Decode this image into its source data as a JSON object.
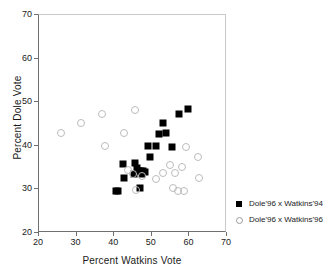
{
  "chart_data": {
    "type": "scatter",
    "title": "",
    "xlabel": "Percent Watkins Vote",
    "ylabel": "Percent Dole Vote",
    "xlim": [
      20,
      70
    ],
    "ylim": [
      20,
      70
    ],
    "xticks": [
      20,
      30,
      40,
      50,
      60,
      70
    ],
    "yticks": [
      20,
      30,
      40,
      50,
      60,
      70
    ],
    "grid": false,
    "legend_position": "right",
    "series": [
      {
        "name": "Dole'96 x Watkins'94",
        "marker": "filled-square",
        "color": "#000000",
        "points": [
          [
            40.7,
            29.4
          ],
          [
            41.3,
            29.5
          ],
          [
            42.6,
            35.6
          ],
          [
            42.9,
            32.3
          ],
          [
            45.9,
            35.9
          ],
          [
            45.4,
            33.3
          ],
          [
            46.3,
            34.6
          ],
          [
            46.8,
            33.9
          ],
          [
            47.3,
            34.0
          ],
          [
            47.6,
            33.2
          ],
          [
            48.0,
            33.9
          ],
          [
            48.4,
            33.8
          ],
          [
            47.2,
            30.1
          ],
          [
            49.3,
            39.7
          ],
          [
            49.8,
            37.1
          ],
          [
            51.5,
            39.8
          ],
          [
            52.2,
            42.5
          ],
          [
            53.3,
            45.0
          ],
          [
            54.0,
            42.8
          ],
          [
            55.6,
            39.5
          ],
          [
            57.6,
            47.1
          ],
          [
            59.9,
            48.1
          ]
        ]
      },
      {
        "name": "Dole'96 x Watkins'96",
        "marker": "open-circle",
        "color": "#bcbcbc",
        "points": [
          [
            26.2,
            42.6
          ],
          [
            31.4,
            45.0
          ],
          [
            37.0,
            47.1
          ],
          [
            37.8,
            39.7
          ],
          [
            43.0,
            42.8
          ],
          [
            44.0,
            34.2
          ],
          [
            45.9,
            48.0
          ],
          [
            45.2,
            33.3
          ],
          [
            46.1,
            29.7
          ],
          [
            47.6,
            32.9
          ],
          [
            51.4,
            32.2
          ],
          [
            53.3,
            33.6
          ],
          [
            55.2,
            35.4
          ],
          [
            55.9,
            30.1
          ],
          [
            56.5,
            33.5
          ],
          [
            57.2,
            29.4
          ],
          [
            58.3,
            34.8
          ],
          [
            58.8,
            29.3
          ],
          [
            59.3,
            39.5
          ],
          [
            62.6,
            37.1
          ],
          [
            62.8,
            32.5
          ]
        ]
      }
    ]
  }
}
